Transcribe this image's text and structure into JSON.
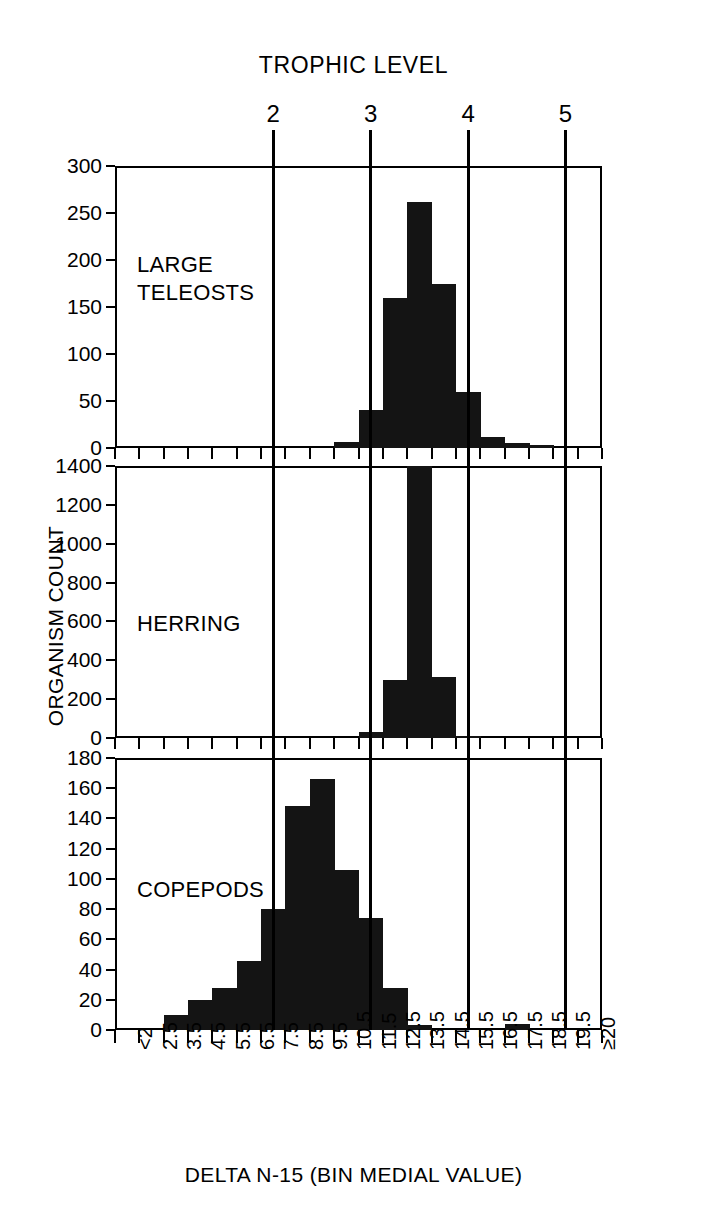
{
  "figure": {
    "trophic_axis_title": "TROPHIC LEVEL",
    "x_axis_title": "DELTA N-15 (BIN MEDIAL VALUE)",
    "y_axis_title": "ORGANISM COUNT",
    "trophic_levels": [
      "2",
      "3",
      "4",
      "5"
    ],
    "trophic_level_bins": [
      7.5,
      11.5,
      15.5,
      19.5
    ],
    "bin_labels": [
      "<2",
      "2.5",
      "3.5",
      "4.5",
      "5.5",
      "6.5",
      "7.5",
      "8.5",
      "9.5",
      "10.5",
      "11.5",
      "12.5",
      "13.5",
      "14.5",
      "15.5",
      "16.5",
      "17.5",
      "18.5",
      "19.5",
      "≥20"
    ],
    "ink_color": "#141414"
  },
  "chart_data": [
    {
      "type": "bar",
      "title": "LARGE TELEOSTS",
      "panel": "large-teleosts",
      "xlabel": "DELTA N-15 (BIN MEDIAL VALUE)",
      "ylabel": "ORGANISM COUNT",
      "categories": [
        "<2",
        "2.5",
        "3.5",
        "4.5",
        "5.5",
        "6.5",
        "7.5",
        "8.5",
        "9.5",
        "10.5",
        "11.5",
        "12.5",
        "13.5",
        "14.5",
        "15.5",
        "16.5",
        "17.5",
        "18.5",
        "19.5",
        "≥20"
      ],
      "values": [
        0,
        0,
        0,
        0,
        0,
        0,
        0,
        0,
        0,
        6,
        40,
        160,
        262,
        175,
        60,
        12,
        5,
        3,
        0,
        0
      ],
      "ylim": [
        0,
        300
      ],
      "yticks": [
        0,
        50,
        100,
        150,
        200,
        250,
        300
      ],
      "grid": false
    },
    {
      "type": "bar",
      "title": "HERRING",
      "panel": "herring",
      "xlabel": "DELTA N-15 (BIN MEDIAL VALUE)",
      "ylabel": "ORGANISM COUNT",
      "categories": [
        "<2",
        "2.5",
        "3.5",
        "4.5",
        "5.5",
        "6.5",
        "7.5",
        "8.5",
        "9.5",
        "10.5",
        "11.5",
        "12.5",
        "13.5",
        "14.5",
        "15.5",
        "16.5",
        "17.5",
        "18.5",
        "19.5",
        "≥20"
      ],
      "values": [
        0,
        0,
        0,
        0,
        0,
        0,
        0,
        0,
        0,
        0,
        30,
        300,
        1680,
        315,
        8,
        0,
        0,
        0,
        0,
        0
      ],
      "clipped_bin": "13.5",
      "clipped_note": "bar exceeds axis maximum (1400)",
      "ylim": [
        0,
        1400
      ],
      "yticks": [
        0,
        200,
        400,
        600,
        800,
        1000,
        1200,
        1400
      ],
      "grid": false
    },
    {
      "type": "bar",
      "title": "COPEPODS",
      "panel": "copepods",
      "xlabel": "DELTA N-15 (BIN MEDIAL VALUE)",
      "ylabel": "ORGANISM COUNT",
      "categories": [
        "<2",
        "2.5",
        "3.5",
        "4.5",
        "5.5",
        "6.5",
        "7.5",
        "8.5",
        "9.5",
        "10.5",
        "11.5",
        "12.5",
        "13.5",
        "14.5",
        "15.5",
        "16.5",
        "17.5",
        "18.5",
        "19.5",
        "≥20"
      ],
      "values": [
        0,
        0,
        10,
        20,
        28,
        46,
        80,
        148,
        166,
        106,
        74,
        28,
        3,
        0,
        0,
        0,
        4,
        0,
        0,
        0
      ],
      "ylim": [
        0,
        180
      ],
      "yticks": [
        0,
        20,
        40,
        60,
        80,
        100,
        120,
        140,
        160,
        180
      ],
      "grid": false
    }
  ]
}
